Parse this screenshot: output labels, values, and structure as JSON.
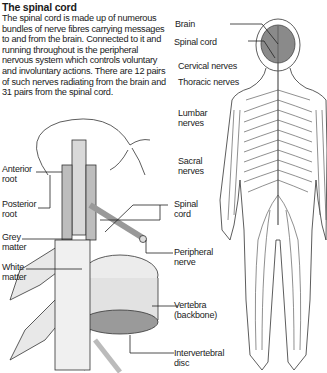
{
  "article": {
    "title": "The spinal cord",
    "body": "The spinal cord is made up of numerous bundles of nerve fibres carrying messages to and from the brain. Connected to it and running throughout is the peripheral nervous system which controls voluntary and involuntary actions. There are 12 pairs of such nerves radiating from the brain and 31 pairs from the spinal cord."
  },
  "body_diagram": {
    "labels": {
      "brain": "Brain",
      "spinal_cord": "Spinal cord",
      "cervical": "Cervical nerves",
      "thoracic": "Thoracic nerves",
      "lumbar_1": "Lumbar",
      "lumbar_2": "nerves",
      "sacral_1": "Sacral",
      "sacral_2": "nerves"
    }
  },
  "cord_diagram": {
    "labels": {
      "anterior_1": "Anterior",
      "anterior_2": "root",
      "posterior_1": "Posterior",
      "posterior_2": "root",
      "grey_1": "Grey",
      "grey_2": "matter",
      "white_1": "White",
      "white_2": "matter",
      "spinal_1": "Spinal",
      "spinal_2": "cord",
      "peripheral_1": "Peripheral",
      "peripheral_2": "nerve",
      "vertebra_1": "Vertebra",
      "vertebra_2": "(backbone)",
      "disc_1": "Intervertebral",
      "disc_2": "disc"
    }
  }
}
